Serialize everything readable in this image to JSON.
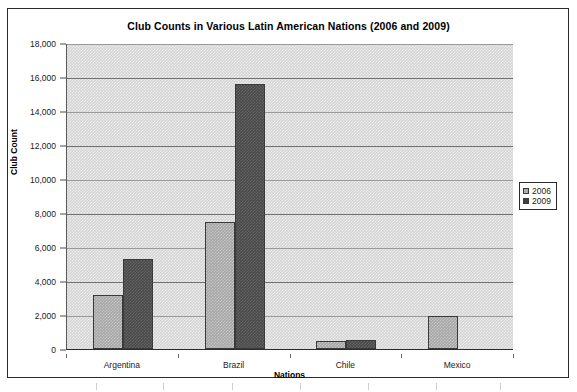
{
  "chart_data": {
    "type": "bar",
    "title": "Club Counts in Various Latin American Nations (2006 and 2009)",
    "xlabel": "Nations",
    "ylabel": "Club Count",
    "categories": [
      "Argentina",
      "Brazil",
      "Chile",
      "Mexico"
    ],
    "series": [
      {
        "name": "2006",
        "values": [
          3200,
          7450,
          480,
          1920
        ],
        "color": "#a6a6a6"
      },
      {
        "name": "2009",
        "values": [
          5300,
          15600,
          520,
          null
        ],
        "color": "#4a4a4a"
      }
    ],
    "ylim": [
      0,
      18000
    ],
    "ytick_values": [
      0,
      2000,
      4000,
      6000,
      8000,
      10000,
      12000,
      14000,
      16000,
      18000
    ],
    "ytick_labels": [
      "0",
      "2,000",
      "4,000",
      "6,000",
      "8,000",
      "10,000",
      "12,000",
      "14,000",
      "16,000",
      "18,000"
    ],
    "grid": true,
    "legend_position": "right",
    "plot_background": "#d4d4d4",
    "frame_border": "#2b2b2b"
  },
  "legend": {
    "entries": [
      {
        "label": "2006"
      },
      {
        "label": "2009"
      }
    ]
  }
}
